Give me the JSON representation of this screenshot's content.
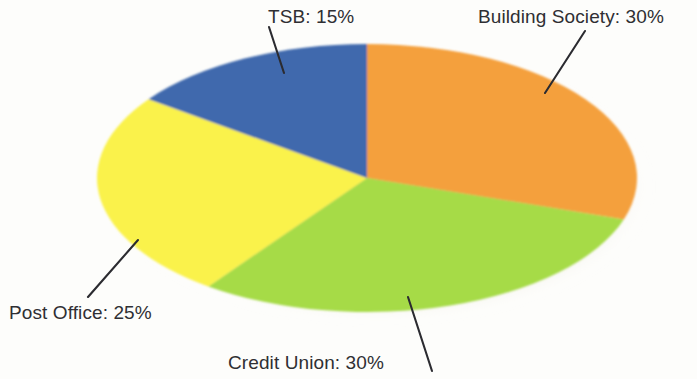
{
  "chart_data": {
    "type": "pie",
    "title": "",
    "subtitle": "",
    "xlabel": "",
    "ylabel": "",
    "legend_position": "none",
    "grid": false,
    "labels_format": "{name}: {value}%",
    "categories": [
      "Building Society",
      "Credit Union",
      "Post Office",
      "TSB"
    ],
    "values": [
      30,
      30,
      25,
      15
    ],
    "units": "percent",
    "total": 100,
    "slices": [
      {
        "name": "Building Society",
        "value": 30,
        "label": "Building Society: 30%",
        "color": "#f4a03c",
        "start_angle_deg": 0,
        "end_angle_deg": 108,
        "leader_line": true
      },
      {
        "name": "Credit Union",
        "value": 30,
        "label": "Credit Union: 30%",
        "color": "#a6db47",
        "start_angle_deg": 108,
        "end_angle_deg": 216,
        "leader_line": true
      },
      {
        "name": "Post Office",
        "value": 25,
        "label": "Post Office: 25%",
        "color": "#faf24c",
        "start_angle_deg": 216,
        "end_angle_deg": 306,
        "leader_line": true
      },
      {
        "name": "TSB",
        "value": 15,
        "label": "TSB: 15%",
        "color": "#3f69ad",
        "start_angle_deg": 306,
        "end_angle_deg": 360,
        "leader_line": true
      }
    ]
  },
  "labels": {
    "tsb": "TSB: 15%",
    "building_society": "Building Society: 30%",
    "post_office": "Post Office: 25%",
    "credit_union": "Credit Union: 30%"
  },
  "colors": {
    "background": "#fdfdfb",
    "text": "#2f2f33",
    "leader_line": "#2b2b30",
    "shadow": "#cfc8b4",
    "building_society": "#f4a03c",
    "credit_union": "#a6db47",
    "post_office": "#faf24c",
    "tsb": "#3f69ad"
  }
}
